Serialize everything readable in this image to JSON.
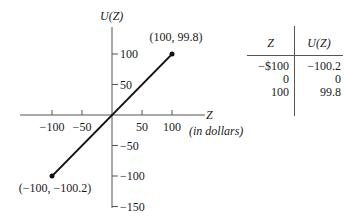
{
  "chart_data": {
    "type": "line",
    "title": "",
    "xlabel": "Z",
    "xlabel_note": "(in dollars)",
    "ylabel": "U(Z)",
    "xlim": [
      -110,
      110
    ],
    "ylim": [
      -155,
      135
    ],
    "x_ticks": [
      -100,
      -50,
      50,
      100
    ],
    "x_tick_labels": [
      "−100",
      "−50",
      "50",
      "100"
    ],
    "y_ticks": [
      100,
      50,
      -50,
      -100,
      -150
    ],
    "y_tick_labels": [
      "100",
      "50",
      "−50",
      "−100",
      "−150"
    ],
    "series": [
      {
        "name": "U(Z)",
        "x": [
          -100,
          100
        ],
        "y": [
          -100.2,
          99.8
        ]
      }
    ],
    "annotations": [
      {
        "x": 100,
        "y": 99.8,
        "text": "(100, 99.8)"
      },
      {
        "x": -100,
        "y": -100.2,
        "text": "(−100, −100.2)"
      }
    ],
    "grid": false,
    "legend": "none"
  },
  "table": {
    "headers": [
      "Z",
      "U(Z)"
    ],
    "rows": [
      [
        "−$100",
        "−100.2"
      ],
      [
        "0",
        "0"
      ],
      [
        "100",
        "99.8"
      ]
    ]
  }
}
